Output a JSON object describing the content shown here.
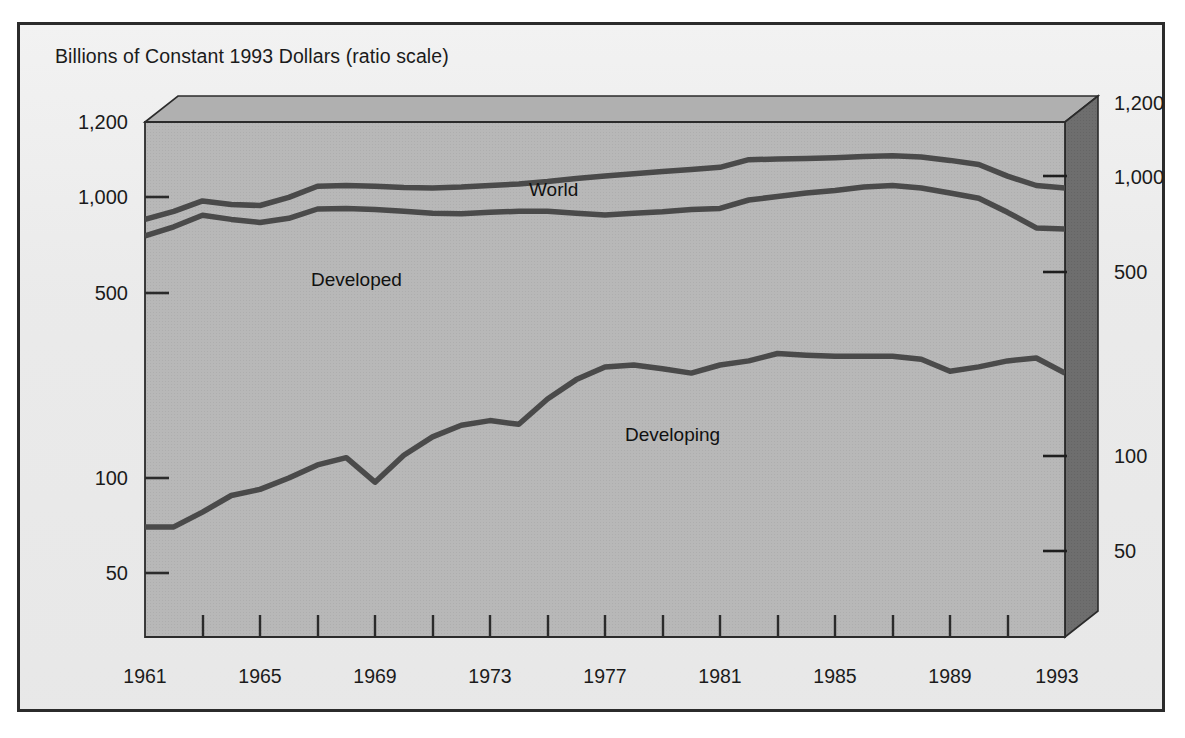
{
  "figure": {
    "title": "Billions of Constant 1993 Dollars (ratio scale)",
    "background_color": "#ebebeb",
    "frame_color": "#2b2b2b",
    "plot_face_color": "#b8b8b8",
    "plot_side_color": "#6e6e6e",
    "line_color": "#4a4a4a"
  },
  "series_labels": {
    "world": "World",
    "developed": "Developed",
    "developing": "Developing"
  },
  "axis": {
    "left_ticks": [
      "1,200",
      "1,000",
      "500",
      "100",
      "50"
    ],
    "right_ticks": [
      "1,200",
      "1,000",
      "500",
      "100",
      "50"
    ],
    "x_ticks": [
      "1961",
      "1965",
      "1969",
      "1973",
      "1977",
      "1981",
      "1985",
      "1989",
      "1993"
    ]
  },
  "chart_data": {
    "type": "line",
    "title": "Billions of Constant 1993 Dollars (ratio scale)",
    "subtitle": "",
    "xlabel": "",
    "ylabel": "Billions of Constant 1993 Dollars (ratio scale)",
    "scale": "log",
    "grid": false,
    "legend": "inline-labels",
    "xlim": [
      1961,
      1993
    ],
    "ylim": [
      30,
      1200
    ],
    "ytick_values": [
      1200,
      1000,
      500,
      100,
      50
    ],
    "ytick_labels": [
      "1,200",
      "1,000",
      "500",
      "100",
      "50"
    ],
    "xtick_values": [
      1961,
      1965,
      1969,
      1973,
      1977,
      1981,
      1985,
      1989,
      1993
    ],
    "xtick_labels": [
      "1961",
      "1965",
      "1969",
      "1973",
      "1977",
      "1981",
      "1985",
      "1989",
      "1993"
    ],
    "x": [
      1961,
      1962,
      1963,
      1964,
      1965,
      1966,
      1967,
      1968,
      1969,
      1970,
      1971,
      1972,
      1973,
      1974,
      1975,
      1976,
      1977,
      1978,
      1979,
      1980,
      1981,
      1982,
      1983,
      1984,
      1985,
      1986,
      1987,
      1988,
      1989,
      1990,
      1991,
      1992,
      1993
    ],
    "series": [
      {
        "name": "World",
        "label": "World",
        "color": "#4a4a4a",
        "values": [
          660,
          700,
          755,
          735,
          730,
          775,
          840,
          845,
          840,
          832,
          830,
          835,
          845,
          855,
          870,
          890,
          905,
          920,
          935,
          950,
          965,
          1020,
          1025,
          1030,
          1035,
          1045,
          1050,
          1040,
          1015,
          985,
          905,
          845,
          830
        ]
      },
      {
        "name": "Developed",
        "label": "Developed",
        "color": "#4a4a4a",
        "values": [
          585,
          625,
          680,
          660,
          645,
          665,
          712,
          715,
          710,
          700,
          690,
          688,
          695,
          700,
          700,
          690,
          682,
          690,
          698,
          710,
          715,
          760,
          780,
          800,
          815,
          835,
          845,
          830,
          800,
          770,
          695,
          620,
          615
        ]
      },
      {
        "name": "Developing",
        "label": "Developing",
        "color": "#4a4a4a",
        "values": [
          70,
          70,
          78,
          88,
          92,
          100,
          110,
          116,
          97,
          118,
          135,
          147,
          152,
          148,
          178,
          205,
          225,
          228,
          222,
          215,
          228,
          235,
          248,
          245,
          243,
          243,
          243,
          238,
          218,
          225,
          235,
          240,
          215
        ]
      }
    ],
    "annotations": [
      {
        "text": "World",
        "x": 1974.5,
        "y": 1090
      },
      {
        "text": "Developed",
        "x": 1966.0,
        "y": 560
      },
      {
        "text": "Developing",
        "x": 1978.0,
        "y": 150
      }
    ]
  }
}
